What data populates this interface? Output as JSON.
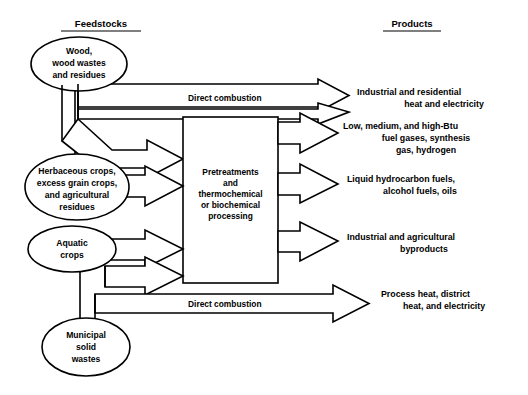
{
  "figure": {
    "background_color": "#ffffff",
    "line_color": "#000000",
    "width": 528,
    "height": 395
  },
  "headers": {
    "feedstocks": "Feedstocks",
    "products": "Products"
  },
  "feedstocks": [
    {
      "id": "wood",
      "lines": [
        "Wood,",
        "wood wastes",
        "and residues"
      ]
    },
    {
      "id": "herbaceous",
      "lines": [
        "Herbaceous crops,",
        "excess grain crops,",
        "and agricultural",
        "residues"
      ]
    },
    {
      "id": "aquatic",
      "lines": [
        "Aquatic",
        "crops"
      ]
    },
    {
      "id": "municipal",
      "lines": [
        "Municipal",
        "solid",
        "wastes"
      ]
    }
  ],
  "process_box": {
    "id": "pretreatment-processing",
    "lines": [
      "Pretreatments",
      "and",
      "thermochemical",
      "or biochemical",
      "processing"
    ]
  },
  "edge_labels": {
    "direct_combustion_top": "Direct combustion",
    "direct_combustion_bottom": "Direct combustion"
  },
  "products": [
    {
      "id": "heat-electricity",
      "lines": [
        "Industrial and residential",
        "heat and electricity"
      ],
      "align": "center"
    },
    {
      "id": "fuel-gases",
      "lines": [
        "Low, medium, and high-Btu",
        "fuel gases, synthesis",
        "gas, hydrogen"
      ],
      "align": "center"
    },
    {
      "id": "liquid-fuels",
      "lines": [
        "Liquid hydrocarbon fuels,",
        "alcohol fuels, oils"
      ],
      "align": "center"
    },
    {
      "id": "byproducts",
      "lines": [
        "Industrial and agricultural",
        "byproducts"
      ],
      "align": "center"
    },
    {
      "id": "process-heat",
      "lines": [
        "Process heat, district",
        "heat, and electricity"
      ],
      "align": "center"
    }
  ]
}
